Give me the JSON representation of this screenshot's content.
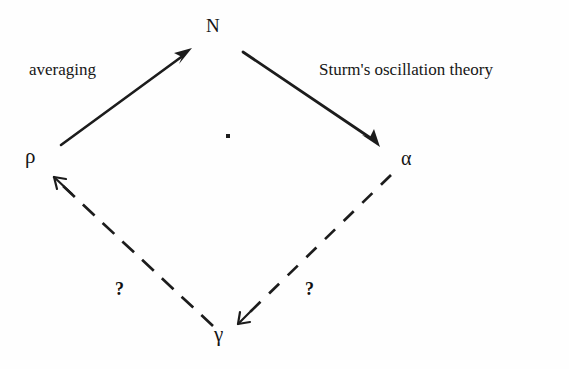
{
  "figure": {
    "kind": "commutative-diagram",
    "background_color": "#fefefe",
    "ink_color": "#1a1a1a",
    "nodes": [
      {
        "id": "N",
        "label": "N",
        "position": "top",
        "x": 213,
        "y": 26
      },
      {
        "id": "rho",
        "label": "ρ",
        "position": "left",
        "x": 31,
        "y": 158
      },
      {
        "id": "alpha",
        "label": "α",
        "position": "right",
        "x": 408,
        "y": 160
      },
      {
        "id": "gamma",
        "label": "γ",
        "position": "bottom",
        "x": 222,
        "y": 336
      }
    ],
    "edges": [
      {
        "id": "rho-to-N",
        "from": "rho",
        "to": "N",
        "style": "solid",
        "arrow": "end",
        "label": "averaging"
      },
      {
        "id": "N-to-alpha",
        "from": "N",
        "to": "alpha",
        "style": "solid",
        "arrow": "end",
        "label": "Sturm's oscillation theory"
      },
      {
        "id": "gamma-to-rho",
        "from": "gamma",
        "to": "rho",
        "style": "dashed",
        "arrow": "end",
        "label": "?"
      },
      {
        "id": "alpha-to-gamma",
        "from": "alpha",
        "to": "gamma",
        "style": "dashed",
        "arrow": "end",
        "label": "?"
      }
    ],
    "marks": [
      {
        "id": "center-dot",
        "shape": "dot",
        "x": 228,
        "y": 137
      }
    ]
  },
  "labels": {
    "node_N": "N",
    "node_rho": "ρ",
    "node_alpha": "α",
    "node_gamma": "γ",
    "edge_averaging": "averaging",
    "edge_sturm": "Sturm's oscillation theory",
    "edge_question_left": "?",
    "edge_question_right": "?"
  }
}
